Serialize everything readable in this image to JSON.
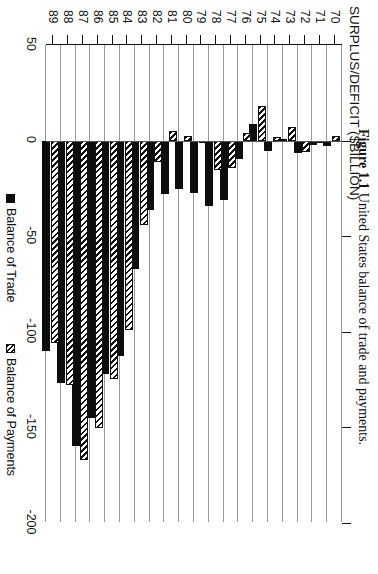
{
  "figure": {
    "caption_label": "Figure 1.1",
    "caption_text": "United States balance of trade and payments."
  },
  "chart_data": {
    "type": "bar",
    "orientation": "vertical-bars-rendered-rotated",
    "title": "",
    "xlabel": "",
    "ylabel": "SURPLUS/DEFICIT ($BILLION)",
    "ylim": [
      -200,
      50
    ],
    "yticks": [
      50,
      0,
      -50,
      -100,
      -150,
      -200
    ],
    "ytick_labels": [
      "50",
      "0",
      "-50",
      "-100",
      "-150",
      "-200"
    ],
    "grid": true,
    "legend_position": "below-axis",
    "categories": [
      "70",
      "71",
      "72",
      "73",
      "74",
      "75",
      "76",
      "77",
      "78",
      "79",
      "80",
      "81",
      "82",
      "83",
      "84",
      "85",
      "86",
      "87",
      "88",
      "89"
    ],
    "series": [
      {
        "name": "Balance of Trade",
        "style": "solid-black",
        "color": "#0d0d0d",
        "values": [
          -2.7,
          -2.3,
          -6.4,
          0.9,
          -5.5,
          8.9,
          -9.5,
          -31.1,
          -34.0,
          -27.6,
          -25.5,
          -28.0,
          -36.5,
          -67.1,
          -112.5,
          -122.2,
          -145.1,
          -159.6,
          -127.0,
          -110.0
        ]
      },
      {
        "name": "Balance of Payments",
        "style": "hatched",
        "color": "#ffffff",
        "values": [
          2.3,
          -1.4,
          -5.8,
          7.1,
          2.0,
          18.1,
          4.2,
          -14.5,
          -15.4,
          -1.0,
          2.3,
          5.0,
          -11.4,
          -44.3,
          -99.0,
          -124.5,
          -150.5,
          -167.0,
          -128.0,
          -106.0
        ]
      }
    ]
  },
  "legend": [
    {
      "label": "Balance of Trade",
      "swatch": "solid-black-swatch"
    },
    {
      "label": "Balance of Payments",
      "swatch": "hatched-swatch"
    }
  ]
}
